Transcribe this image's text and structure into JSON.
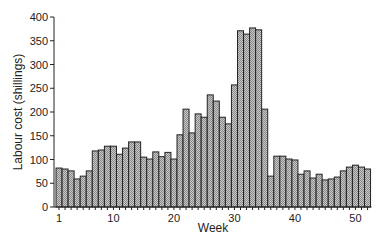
{
  "chart_data": {
    "type": "bar",
    "title": "",
    "xlabel": "Week",
    "ylabel": "Labour cost (shillings)",
    "ylim": [
      0,
      400
    ],
    "yticks": [
      0,
      50,
      100,
      150,
      200,
      250,
      300,
      350,
      400
    ],
    "xticks": [
      1,
      10,
      20,
      30,
      40,
      50
    ],
    "grid": false,
    "legend": null,
    "categories": [
      1,
      2,
      3,
      4,
      5,
      6,
      7,
      8,
      9,
      10,
      11,
      12,
      13,
      14,
      15,
      16,
      17,
      18,
      19,
      20,
      21,
      22,
      23,
      24,
      25,
      26,
      27,
      28,
      29,
      30,
      31,
      32,
      33,
      34,
      35,
      36,
      37,
      38,
      39,
      40,
      41,
      42,
      43,
      44,
      45,
      46,
      47,
      48,
      49,
      50,
      51,
      52
    ],
    "values": [
      82,
      80,
      76,
      59,
      65,
      76,
      118,
      120,
      128,
      128,
      111,
      124,
      137,
      137,
      105,
      101,
      116,
      106,
      115,
      101,
      152,
      206,
      156,
      196,
      189,
      236,
      223,
      189,
      175,
      257,
      371,
      364,
      377,
      373,
      206,
      65,
      107,
      107,
      101,
      99,
      69,
      76,
      61,
      69,
      57,
      59,
      63,
      76,
      84,
      88,
      84,
      80
    ]
  },
  "colors": {
    "bar_fill": "#b4b4b4",
    "bar_stroke": "#222222",
    "axis": "#222222"
  }
}
